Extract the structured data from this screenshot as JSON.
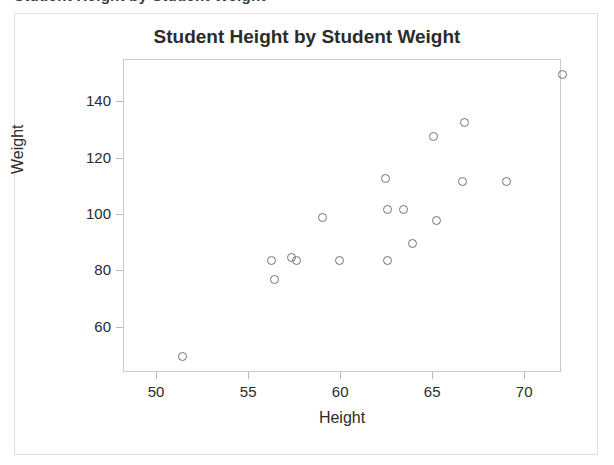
{
  "top_partial_text": "Student Height by Student Weight",
  "figure": {
    "title": "Student Height by Student Weight",
    "x_axis": {
      "label": "Height",
      "ticks": [
        50,
        55,
        60,
        65,
        70
      ],
      "min": 48.2,
      "max": 72.0
    },
    "y_axis": {
      "label": "Weight",
      "ticks": [
        60,
        80,
        100,
        120,
        140
      ],
      "min": 44.0,
      "max": 155.0
    },
    "marker": {
      "shape": "open-circle",
      "color": "#6f7378",
      "size_px": 9
    },
    "frame_color": "#c9c9c9",
    "background": "#ffffff"
  },
  "chart_data": {
    "type": "scatter",
    "title": "Student Height by Student Weight",
    "xlabel": "Height",
    "ylabel": "Weight",
    "xlim": [
      48.2,
      72.0
    ],
    "ylim": [
      44.0,
      155.0
    ],
    "xticks": [
      50,
      55,
      60,
      65,
      70
    ],
    "yticks": [
      60,
      80,
      100,
      120,
      140
    ],
    "grid": false,
    "legend": null,
    "series": [
      {
        "name": "students",
        "marker": "open-circle",
        "color": "#6f7378",
        "points": [
          {
            "x": 51.4,
            "y": 50
          },
          {
            "x": 56.2,
            "y": 84
          },
          {
            "x": 56.4,
            "y": 77
          },
          {
            "x": 57.3,
            "y": 85
          },
          {
            "x": 57.6,
            "y": 84
          },
          {
            "x": 59.0,
            "y": 99
          },
          {
            "x": 59.9,
            "y": 84
          },
          {
            "x": 62.4,
            "y": 113
          },
          {
            "x": 62.5,
            "y": 102
          },
          {
            "x": 62.5,
            "y": 84
          },
          {
            "x": 63.4,
            "y": 102
          },
          {
            "x": 63.9,
            "y": 90
          },
          {
            "x": 65.0,
            "y": 128
          },
          {
            "x": 65.2,
            "y": 98
          },
          {
            "x": 66.7,
            "y": 133
          },
          {
            "x": 66.6,
            "y": 112
          },
          {
            "x": 69.0,
            "y": 112
          },
          {
            "x": 72.0,
            "y": 150
          }
        ]
      }
    ]
  }
}
